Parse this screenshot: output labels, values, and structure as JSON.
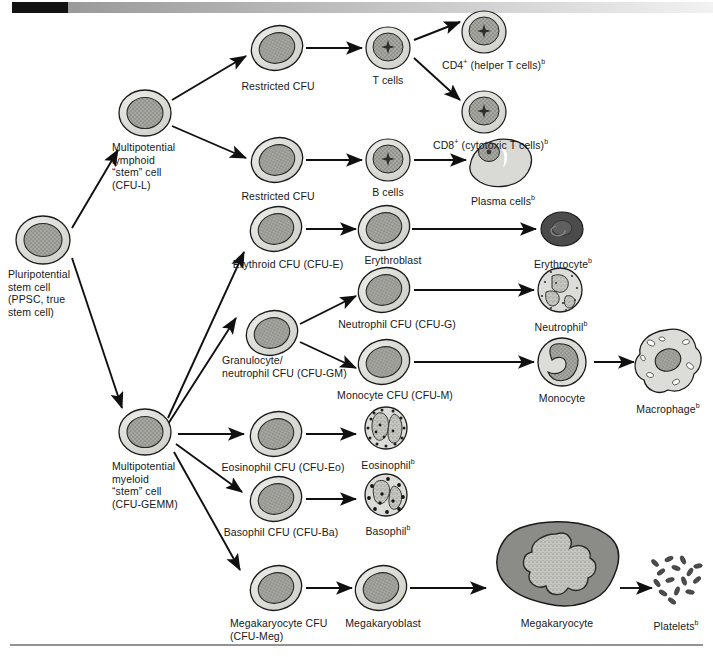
{
  "figure": {
    "header_bar": {
      "black_label": "",
      "gradient": true
    },
    "colors": {
      "cell_outer": "#d6d6d2",
      "cell_nucleus": "#9d9d98",
      "erythrocyte": "#4e4e4e",
      "megakaryocyte_cyto": "#8a8a86",
      "megakaryocyte_nucleus": "#c2c2bd",
      "stroke": "#1a1a1a",
      "text": "#16181a"
    }
  },
  "labels": {
    "ppsc": "Pluripotential\nstem cell\n(PPSC, true\nstem cell)",
    "cfu_l": "Multipotential\nlymphoid\n“stem” cell\n(CFU-L)",
    "cfu_gemm": "Multipotential\nmyeloid\n“stem” cell\n(CFU-GEMM)",
    "restricted_cfu_t": "Restricted CFU",
    "restricted_cfu_b": "Restricted CFU",
    "t_cells": "T cells",
    "b_cells": "B cells",
    "cd4": "CD4",
    "cd4_rest": " (helper T cells)",
    "cd8": "CD8",
    "cd8_rest": " (cytotoxic T cells)",
    "plasma_cells": "Plasma cells",
    "erythroid_cfu": "Erythroid CFU (CFU-E)",
    "erythroblast": "Erythroblast",
    "erythrocyte": "Erythrocyte",
    "cfu_gm": "Granulocyte/\nneutrophil CFU (CFU-GM)",
    "cfu_g": "Neutrophil CFU (CFU-G)",
    "cfu_m": "Monocyte CFU (CFU-M)",
    "neutrophil": "Neutrophil",
    "monocyte": "Monocyte",
    "macrophage": "Macrophage",
    "cfu_eo": "Eosinophil CFU (CFU-Eo)",
    "eosinophil": "Eosinophil",
    "cfu_ba": "Basophil CFU (CFU-Ba)",
    "basophil": "Basophil",
    "cfu_meg": "Megakaryocyte CFU\n(CFU-Meg)",
    "megakaryoblast": "Megakaryoblast",
    "megakaryocyte": "Megakaryocyte",
    "platelets": "Platelets",
    "sup_b": "b",
    "sup_plus": "+"
  },
  "lineages": [
    {
      "name": "lymphoid",
      "chain": [
        "Pluripotential stem cell",
        "Multipotential lymphoid “stem” cell (CFU-L)",
        "Restricted CFU",
        "T cells",
        "CD4+ (helper T cells)"
      ]
    },
    {
      "name": "lymphoid-cd8",
      "chain": [
        "T cells",
        "CD8+ (cytotoxic T cells)"
      ]
    },
    {
      "name": "b-lineage",
      "chain": [
        "Multipotential lymphoid “stem” cell (CFU-L)",
        "Restricted CFU",
        "B cells",
        "Plasma cells"
      ]
    },
    {
      "name": "erythroid",
      "chain": [
        "Multipotential myeloid “stem” cell (CFU-GEMM)",
        "Erythroid CFU (CFU-E)",
        "Erythroblast",
        "Erythrocyte"
      ]
    },
    {
      "name": "granulocyte-monocyte",
      "chain": [
        "Multipotential myeloid “stem” cell (CFU-GEMM)",
        "Granulocyte/neutrophil CFU (CFU-GM)",
        "Neutrophil CFU (CFU-G)",
        "Neutrophil"
      ]
    },
    {
      "name": "monocyte-macrophage",
      "chain": [
        "Granulocyte/neutrophil CFU (CFU-GM)",
        "Monocyte CFU (CFU-M)",
        "Monocyte",
        "Macrophage"
      ]
    },
    {
      "name": "eosinophil",
      "chain": [
        "Multipotential myeloid “stem” cell (CFU-GEMM)",
        "Eosinophil CFU (CFU-Eo)",
        "Eosinophil"
      ]
    },
    {
      "name": "basophil",
      "chain": [
        "Multipotential myeloid “stem” cell (CFU-GEMM)",
        "Basophil CFU (CFU-Ba)",
        "Basophil"
      ]
    },
    {
      "name": "megakaryocyte",
      "chain": [
        "Multipotential myeloid “stem” cell (CFU-GEMM)",
        "Megakaryocyte CFU (CFU-Meg)",
        "Megakaryoblast",
        "Megakaryocyte",
        "Platelets"
      ]
    }
  ]
}
